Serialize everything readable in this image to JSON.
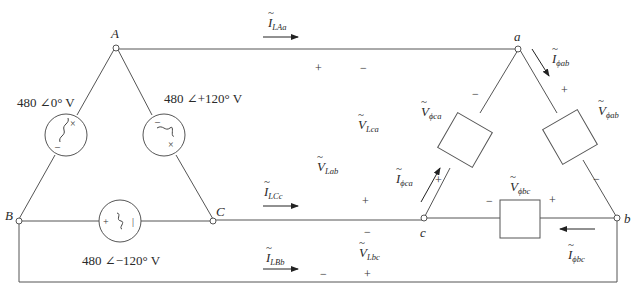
{
  "diagram": {
    "type": "three-phase delta-delta circuit",
    "source_nodes": [
      {
        "id": "A",
        "label": "A"
      },
      {
        "id": "B",
        "label": "B"
      },
      {
        "id": "C",
        "label": "C"
      }
    ],
    "load_nodes": [
      {
        "id": "a",
        "label": "a"
      },
      {
        "id": "b",
        "label": "b"
      },
      {
        "id": "c",
        "label": "c"
      }
    ],
    "sources": [
      {
        "id": "src-AB",
        "between": "A-B",
        "label": "480 ∠0° V"
      },
      {
        "id": "src-AC",
        "between": "A-C",
        "label": "480 ∠+120° V"
      },
      {
        "id": "src-BC",
        "between": "B-C",
        "label": "480 ∠−120° V"
      }
    ],
    "line_currents": [
      {
        "id": "I_LAa",
        "symbol": "I",
        "subscript": "LAa"
      },
      {
        "id": "I_LCc",
        "symbol": "I",
        "subscript": "LCc"
      },
      {
        "id": "I_LBb",
        "symbol": "I",
        "subscript": "LBb"
      }
    ],
    "line_voltages": [
      {
        "id": "V_Lca",
        "symbol": "V",
        "subscript": "Lca"
      },
      {
        "id": "V_Lab",
        "symbol": "V",
        "subscript": "Lab"
      },
      {
        "id": "V_Lbc",
        "symbol": "V",
        "subscript": "Lbc"
      }
    ],
    "phase_currents": [
      {
        "id": "I_phab",
        "symbol": "I",
        "subscript": "ϕab"
      },
      {
        "id": "I_phca",
        "symbol": "I",
        "subscript": "ϕca"
      },
      {
        "id": "I_phbc",
        "symbol": "I",
        "subscript": "ϕbc"
      }
    ],
    "phase_voltages": [
      {
        "id": "V_phca",
        "symbol": "V",
        "subscript": "ϕca"
      },
      {
        "id": "V_phab",
        "symbol": "V",
        "subscript": "ϕab"
      },
      {
        "id": "V_phbc",
        "symbol": "V",
        "subscript": "ϕbc"
      }
    ],
    "impedances": [
      {
        "id": "Z-ca",
        "label": "Z"
      },
      {
        "id": "Z-ab",
        "label": "Z"
      },
      {
        "id": "Z-bc",
        "label": "Z"
      }
    ],
    "impedance_value": "Z = 3.5 + j14.8 Ω",
    "signs": {
      "plus": "+",
      "minus": "−"
    },
    "colors": {
      "wire": "#555555",
      "text": "#2a2a2a"
    }
  }
}
